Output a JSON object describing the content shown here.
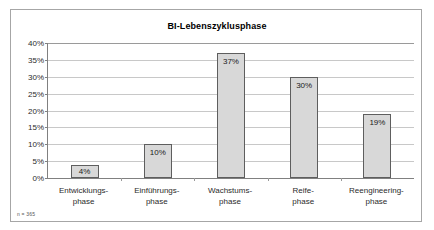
{
  "figure": {
    "footnote": "n = 365"
  },
  "chart_data": {
    "type": "bar",
    "title": "BI-Lebenszyklusphase",
    "xlabel": "",
    "ylabel": "",
    "categories": [
      "Entwicklungs-\nphase",
      "Einführungs-\nphase",
      "Wachstums-\nphase",
      "Reife-\nphase",
      "Reengineering-\nphase"
    ],
    "category_lines": [
      [
        "Entwicklungs-",
        "phase"
      ],
      [
        "Einführungs-",
        "phase"
      ],
      [
        "Wachstums-",
        "phase"
      ],
      [
        "Reife-",
        "phase"
      ],
      [
        "Reengineering-",
        "phase"
      ]
    ],
    "values": [
      4,
      10,
      37,
      30,
      19
    ],
    "value_labels": [
      "4%",
      "10%",
      "37%",
      "30%",
      "19%"
    ],
    "ylim": [
      0,
      40
    ],
    "ytick_values": [
      0,
      5,
      10,
      15,
      20,
      25,
      30,
      35,
      40
    ],
    "ytick_labels": [
      "0%",
      "5%",
      "10%",
      "15%",
      "20%",
      "25%",
      "30%",
      "35%",
      "40%"
    ],
    "grid": true,
    "legend": false,
    "bar_fill_color": "#d8d8d8",
    "bar_border_color": "#5e5e5e",
    "gridline_color": "#c8c8c8",
    "axis_color": "#808080"
  }
}
